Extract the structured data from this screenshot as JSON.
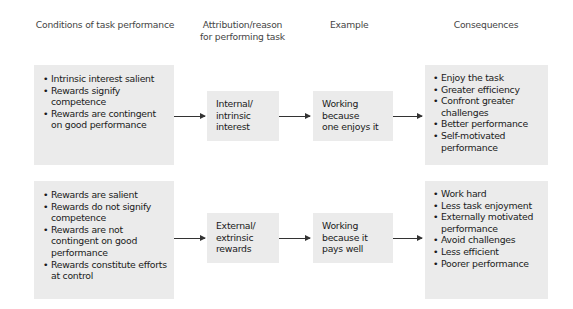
{
  "headers": {
    "conditions": "Conditions of task performance",
    "attribution": "Attribution/reason for performing task",
    "attribution_line1": "Attribution/reason",
    "attribution_line2": "for performing task",
    "example": "Example",
    "consequences": "Consequences"
  },
  "rows": [
    {
      "conditions": [
        "Intrinsic interest salient",
        "Rewards signify competence",
        "Rewards are contingent on good performance"
      ],
      "attribution": [
        "Internal/",
        "intrinsic",
        "interest"
      ],
      "example": [
        "Working",
        "because",
        "one enjoys it"
      ],
      "consequences": [
        "Enjoy the task",
        "Greater efficiency",
        "Confront greater challenges",
        "Better performance",
        "Self-motivated performance"
      ]
    },
    {
      "conditions": [
        "Rewards are salient",
        "Rewards do not signify competence",
        "Rewards are not contingent on good performance",
        "Rewards constitute efforts at control"
      ],
      "attribution": [
        "External/",
        "extrinsic",
        "rewards"
      ],
      "example": [
        "Working",
        "because it",
        "pays well"
      ],
      "consequences": [
        "Work hard",
        "Less task enjoyment",
        "Externally motivated performance",
        "Avoid challenges",
        "Less efficient",
        "Poorer performance"
      ]
    }
  ],
  "colors": {
    "box_fill": "#ebebeb",
    "text": "#1a1a1a",
    "header_text": "#444444",
    "arrow": "#333333"
  }
}
